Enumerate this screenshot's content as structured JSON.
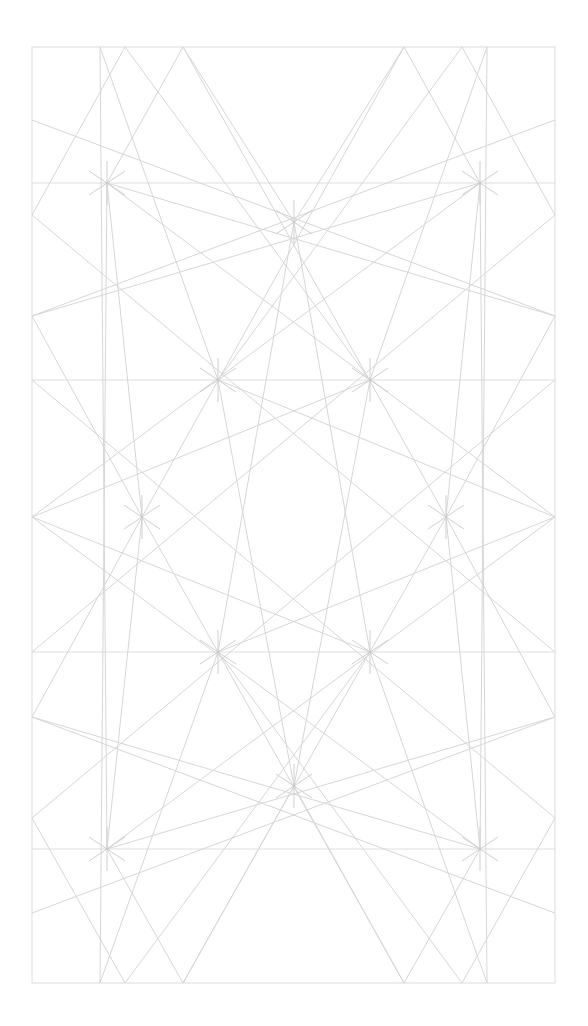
{
  "diagram": {
    "type": "geometric-line-pattern",
    "colors": {
      "background": "#ffffff",
      "line": "#d6d6d6",
      "frame": "#dcdcdc"
    },
    "frame": {
      "x1": 32,
      "y1": 47,
      "x2": 555,
      "y2": 983
    },
    "horizontals": [
      183,
      380,
      652,
      849
    ],
    "vertices": [
      [
        100,
        47
      ],
      [
        125,
        47
      ],
      [
        183,
        47
      ],
      [
        404,
        47
      ],
      [
        462,
        47
      ],
      [
        487,
        47
      ],
      [
        100,
        983
      ],
      [
        125,
        983
      ],
      [
        183,
        983
      ],
      [
        404,
        983
      ],
      [
        462,
        983
      ],
      [
        487,
        983
      ],
      [
        32,
        120
      ],
      [
        32,
        215
      ],
      [
        32,
        316
      ],
      [
        32,
        517
      ],
      [
        32,
        717
      ],
      [
        32,
        818
      ],
      [
        32,
        913
      ],
      [
        555,
        120
      ],
      [
        555,
        215
      ],
      [
        555,
        316
      ],
      [
        555,
        517
      ],
      [
        555,
        717
      ],
      [
        555,
        818
      ],
      [
        555,
        913
      ],
      [
        107,
        183
      ],
      [
        480,
        183
      ],
      [
        107,
        849
      ],
      [
        480,
        849
      ],
      [
        218,
        380
      ],
      [
        370,
        380
      ],
      [
        218,
        652
      ],
      [
        370,
        652
      ],
      [
        142,
        517
      ],
      [
        446,
        517
      ],
      [
        294,
        222
      ],
      [
        294,
        786
      ]
    ],
    "segments": [
      [
        100,
        47,
        218,
        380
      ],
      [
        125,
        47,
        32,
        215
      ],
      [
        125,
        47,
        370,
        380
      ],
      [
        183,
        47,
        107,
        183
      ],
      [
        183,
        47,
        294,
        222
      ],
      [
        183,
        47,
        446,
        517
      ],
      [
        487,
        47,
        370,
        380
      ],
      [
        462,
        47,
        555,
        215
      ],
      [
        462,
        47,
        218,
        380
      ],
      [
        404,
        47,
        480,
        183
      ],
      [
        404,
        47,
        294,
        222
      ],
      [
        404,
        47,
        142,
        517
      ],
      [
        100,
        983,
        218,
        652
      ],
      [
        125,
        983,
        32,
        818
      ],
      [
        125,
        983,
        370,
        652
      ],
      [
        183,
        983,
        107,
        849
      ],
      [
        183,
        983,
        294,
        786
      ],
      [
        183,
        983,
        446,
        517
      ],
      [
        487,
        983,
        370,
        652
      ],
      [
        462,
        983,
        555,
        818
      ],
      [
        462,
        983,
        218,
        652
      ],
      [
        404,
        983,
        480,
        849
      ],
      [
        404,
        983,
        294,
        786
      ],
      [
        404,
        983,
        142,
        517
      ],
      [
        32,
        120,
        555,
        316
      ],
      [
        555,
        120,
        32,
        316
      ],
      [
        32,
        316,
        480,
        183
      ],
      [
        555,
        316,
        107,
        183
      ],
      [
        32,
        913,
        555,
        717
      ],
      [
        555,
        913,
        32,
        717
      ],
      [
        32,
        717,
        480,
        849
      ],
      [
        555,
        717,
        107,
        849
      ],
      [
        32,
        517,
        370,
        380
      ],
      [
        555,
        517,
        218,
        380
      ],
      [
        32,
        517,
        370,
        652
      ],
      [
        555,
        517,
        218,
        652
      ],
      [
        32,
        316,
        142,
        517
      ],
      [
        555,
        316,
        446,
        517
      ],
      [
        32,
        717,
        142,
        517
      ],
      [
        555,
        717,
        446,
        517
      ],
      [
        107,
        183,
        142,
        517
      ],
      [
        480,
        183,
        446,
        517
      ],
      [
        107,
        849,
        142,
        517
      ],
      [
        480,
        849,
        446,
        517
      ],
      [
        107,
        183,
        555,
        517
      ],
      [
        480,
        183,
        32,
        517
      ],
      [
        107,
        849,
        555,
        517
      ],
      [
        480,
        849,
        32,
        517
      ],
      [
        294,
        222,
        218,
        652
      ],
      [
        294,
        222,
        370,
        652
      ],
      [
        294,
        786,
        218,
        380
      ],
      [
        294,
        786,
        370,
        380
      ],
      [
        32,
        215,
        555,
        652
      ],
      [
        555,
        215,
        32,
        652
      ],
      [
        32,
        818,
        555,
        380
      ],
      [
        555,
        818,
        32,
        380
      ],
      [
        107,
        183,
        100,
        983
      ],
      [
        480,
        183,
        487,
        983
      ],
      [
        107,
        849,
        100,
        47
      ],
      [
        480,
        849,
        487,
        47
      ]
    ],
    "star_points": [
      [
        107,
        183
      ],
      [
        480,
        183
      ],
      [
        218,
        380
      ],
      [
        370,
        380
      ],
      [
        142,
        517
      ],
      [
        446,
        517
      ],
      [
        218,
        652
      ],
      [
        370,
        652
      ],
      [
        107,
        849
      ],
      [
        480,
        849
      ],
      [
        294,
        222
      ],
      [
        294,
        786
      ]
    ],
    "center_circle": {
      "cx": 294,
      "cy": 517,
      "r": 72
    }
  }
}
